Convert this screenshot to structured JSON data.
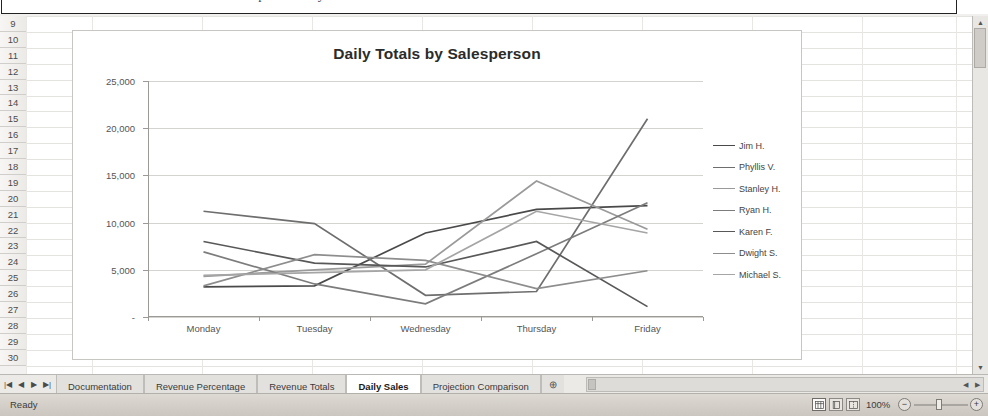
{
  "window": {
    "clipped_title": "Completed Daily Totals chart"
  },
  "grid": {
    "row_headers": [
      "9",
      "10",
      "11",
      "12",
      "13",
      "14",
      "15",
      "16",
      "17",
      "18",
      "19",
      "20",
      "21",
      "22",
      "23",
      "24",
      "25",
      "26",
      "27",
      "28",
      "29",
      "30"
    ]
  },
  "chart_data": {
    "type": "line",
    "title": "Daily Totals by Salesperson",
    "xlabel": "",
    "ylabel": "",
    "categories": [
      "Monday",
      "Tuesday",
      "Wednesday",
      "Thursday",
      "Friday"
    ],
    "ylim": [
      0,
      25000
    ],
    "ytick_labels": [
      "-",
      "5,000",
      "10,000",
      "15,000",
      "20,000",
      "25,000"
    ],
    "ytick_values": [
      0,
      5000,
      10000,
      15000,
      20000,
      25000
    ],
    "grid": "horizontal",
    "legend_position": "right",
    "series": [
      {
        "name": "Jim H.",
        "color": "#4a4a4a",
        "values": [
          3200,
          3300,
          8900,
          11400,
          11800
        ]
      },
      {
        "name": "Phyllis V.",
        "color": "#6e6e6e",
        "values": [
          11200,
          9900,
          2300,
          2700,
          21000
        ]
      },
      {
        "name": "Stanley H.",
        "color": "#9a9a9a",
        "values": [
          4300,
          5000,
          5600,
          14400,
          9300
        ]
      },
      {
        "name": "Ryan H.",
        "color": "#7c7c7c",
        "values": [
          6900,
          3500,
          1400,
          6700,
          12100
        ]
      },
      {
        "name": "Karen F.",
        "color": "#585858",
        "values": [
          8000,
          5700,
          5300,
          8000,
          1100
        ]
      },
      {
        "name": "Dwight S.",
        "color": "#8d8d8d",
        "values": [
          3300,
          6600,
          6000,
          3000,
          4900
        ]
      },
      {
        "name": "Michael S.",
        "color": "#a5a5a5",
        "values": [
          4400,
          4700,
          5000,
          11200,
          8900
        ]
      }
    ]
  },
  "sheet_tabs": {
    "nav": [
      "|◀",
      "◀",
      "▶",
      "▶|"
    ],
    "items": [
      {
        "label": "Documentation",
        "active": false
      },
      {
        "label": "Revenue Percentage",
        "active": false
      },
      {
        "label": "Revenue Totals",
        "active": false
      },
      {
        "label": "Daily Sales",
        "active": true
      },
      {
        "label": "Projection Comparison",
        "active": false
      }
    ],
    "add_sheet_icon": "⊕"
  },
  "status_bar": {
    "ready_label": "Ready",
    "zoom_label": "100%",
    "zoom_out_icon": "−",
    "zoom_in_icon": "+",
    "view_buttons": [
      "normal-view-icon",
      "page-layout-icon",
      "page-break-icon"
    ]
  }
}
